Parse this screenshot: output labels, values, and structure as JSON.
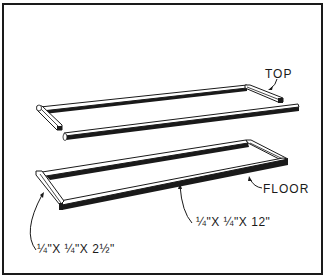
{
  "diagram": {
    "frame_color": "#1a1a1a",
    "background": "#ffffff",
    "parts": [
      {
        "id": "top",
        "label": "TOP"
      },
      {
        "id": "floor",
        "label": "FLOOR"
      }
    ],
    "dimensions": {
      "long_rail": "¼\"X ¼\"X 12\"",
      "short_rail": "¼\"X ¼\"X 2½\""
    }
  }
}
